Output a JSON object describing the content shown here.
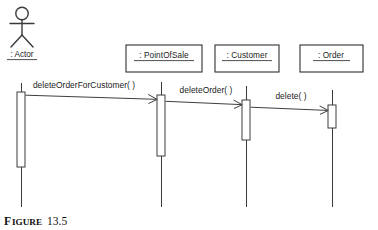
{
  "figure": {
    "caption_prefix": "F",
    "caption_word": "IGURE",
    "caption_number": "13.5",
    "caption_full": "FIGURE 13.5"
  },
  "diagram": {
    "type": "uml-sequence-diagram",
    "actor": {
      "label": ": Actor",
      "underlined": true,
      "lifeline_x": 21
    },
    "participants": [
      {
        "label": ": PointOfSale",
        "underlined": true,
        "lifeline_x": 161,
        "box": {
          "x": 126,
          "y": 45,
          "width": 76,
          "height": 27
        },
        "activation": {
          "x": 157,
          "y": 95,
          "width": 8,
          "height": 61
        }
      },
      {
        "label": ": Customer",
        "underlined": true,
        "lifeline_x": 246,
        "box": {
          "x": 215,
          "y": 45,
          "width": 64,
          "height": 27
        },
        "activation": {
          "x": 242,
          "y": 100,
          "width": 8,
          "height": 40
        }
      },
      {
        "label": ": Order",
        "underlined": true,
        "lifeline_x": 332,
        "box": {
          "x": 300,
          "y": 45,
          "width": 63,
          "height": 27
        },
        "activation": {
          "x": 328,
          "y": 105,
          "width": 8,
          "height": 23
        }
      }
    ],
    "actor_activation": {
      "x": 17,
      "y": 92,
      "width": 8,
      "height": 75
    },
    "messages": [
      {
        "label": "deleteOrderForCustomer( )",
        "from": ": Actor",
        "to": ": PointOfSale",
        "order": 1,
        "label_x": 84,
        "label_y": 88,
        "from_x": 25,
        "to_x": 157,
        "from_y": 95,
        "to_y": 99
      },
      {
        "label": "deleteOrder( )",
        "from": ": PointOfSale",
        "to": ": Customer",
        "order": 2,
        "label_x": 206,
        "label_y": 93,
        "from_x": 165,
        "to_x": 242,
        "from_y": 101,
        "to_y": 104
      },
      {
        "label": "delete( )",
        "from": ": Customer",
        "to": ": Order",
        "order": 3,
        "label_x": 291,
        "label_y": 98,
        "from_x": 250,
        "to_x": 328,
        "from_y": 107,
        "to_y": 110
      }
    ],
    "lifeline_top_y": 82,
    "lifeline_bottom_y": 207,
    "colors": {
      "stroke": "#3a3a3a",
      "box_stroke": "#2f2f2f",
      "fill": "#ffffff",
      "text": "#1b1b1b",
      "background": "#ffffff"
    }
  }
}
